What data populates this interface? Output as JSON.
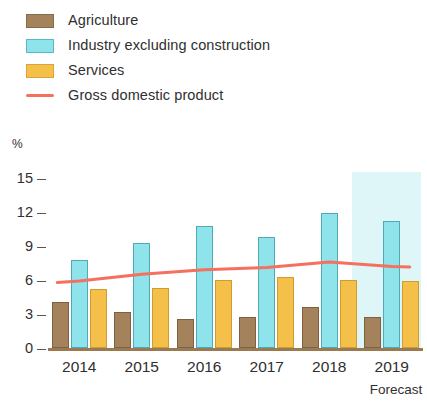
{
  "legend": {
    "items": [
      {
        "label": "Agriculture",
        "marker": "swatch",
        "color": "#a4835c"
      },
      {
        "label": "Industry excluding construction",
        "marker": "swatch",
        "color": "#8fe3ea"
      },
      {
        "label": "Services",
        "marker": "swatch",
        "color": "#f5c04a"
      },
      {
        "label": "Gross domestic product",
        "marker": "line",
        "color": "#f4705f"
      }
    ]
  },
  "axis": {
    "unit_label": "%",
    "y_ticks": [
      "15",
      "12",
      "9",
      "6",
      "3",
      "0"
    ],
    "x_ticks": [
      "2014",
      "2015",
      "2016",
      "2017",
      "2018",
      "2019"
    ]
  },
  "annotations": {
    "forecast_label": "Forecast"
  },
  "chart_data": {
    "type": "bar",
    "title": "",
    "xlabel": "",
    "ylabel": "%",
    "ylim": [
      0,
      15
    ],
    "yticks": [
      0,
      3,
      6,
      9,
      12,
      15
    ],
    "grid": false,
    "legend_position": "top-left",
    "categories": [
      "2014",
      "2015",
      "2016",
      "2017",
      "2018",
      "2019"
    ],
    "series": [
      {
        "name": "Agriculture",
        "type": "bar",
        "color": "#a4835c",
        "values": [
          4.1,
          3.2,
          2.6,
          2.7,
          3.6,
          2.7
        ]
      },
      {
        "name": "Industry excluding construction",
        "type": "bar",
        "color": "#8fe3ea",
        "values": [
          7.8,
          9.3,
          10.8,
          9.8,
          11.9,
          11.2
        ]
      },
      {
        "name": "Services",
        "type": "bar",
        "color": "#f5c04a",
        "values": [
          5.2,
          5.3,
          6.0,
          6.3,
          6.0,
          5.9
        ]
      },
      {
        "name": "Gross domestic product",
        "type": "line",
        "color": "#f4705f",
        "values": [
          5.9,
          6.5,
          6.9,
          7.1,
          7.6,
          7.2
        ]
      }
    ],
    "annotations": [
      {
        "text": "Forecast",
        "category": "2019",
        "note": "shaded band covers the 2019 category"
      }
    ]
  }
}
